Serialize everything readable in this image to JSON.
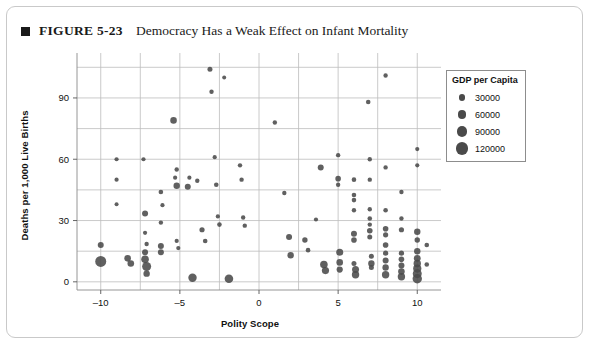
{
  "figure": {
    "marker_icon": "square-bullet-icon",
    "number": "FIGURE 5-23",
    "title": "Democracy Has a Weak Effect on Infant Mortality"
  },
  "legend": {
    "title": "GDP per Capita",
    "entries": [
      {
        "label": "30000",
        "size": 5.0
      },
      {
        "label": "60000",
        "size": 6.4
      },
      {
        "label": "90000",
        "size": 7.8
      },
      {
        "label": "120000",
        "size": 9.4
      }
    ]
  },
  "chart_data": {
    "type": "scatter",
    "title": "Democracy Has a Weak Effect on Infant Mortality",
    "xlabel": "Polity Scope",
    "ylabel": "Deaths per 1,000 Live Births",
    "xlim": [
      -11.5,
      11.5
    ],
    "ylim": [
      -4,
      112
    ],
    "xticks": [
      -10,
      -5,
      0,
      5,
      10
    ],
    "xtick_labels": [
      "–10",
      "–5",
      "0",
      "5",
      "10"
    ],
    "yticks": [
      0,
      30,
      60,
      90
    ],
    "ytick_labels": [
      "0",
      "30",
      "60",
      "90"
    ],
    "grid": true,
    "grid_x_step": 2.5,
    "grid_y_step": 15,
    "legend_position": "right",
    "size_encoding": "GDP per Capita",
    "size_legend_values": [
      30000,
      60000,
      90000,
      120000
    ],
    "marker_color": "#4a4a4a",
    "points": [
      {
        "x": -10.0,
        "y": 18.0,
        "s": 6.0
      },
      {
        "x": -10.0,
        "y": 10.0,
        "s": 11.0
      },
      {
        "x": -9.0,
        "y": 60.0,
        "s": 4.2
      },
      {
        "x": -9.0,
        "y": 50.0,
        "s": 4.2
      },
      {
        "x": -9.0,
        "y": 38.0,
        "s": 4.0
      },
      {
        "x": -8.3,
        "y": 11.5,
        "s": 6.6
      },
      {
        "x": -8.1,
        "y": 9.0,
        "s": 6.6
      },
      {
        "x": -7.3,
        "y": 60.0,
        "s": 4.2
      },
      {
        "x": -7.2,
        "y": 33.5,
        "s": 6.0
      },
      {
        "x": -7.2,
        "y": 24.0,
        "s": 4.2
      },
      {
        "x": -7.1,
        "y": 18.5,
        "s": 4.4
      },
      {
        "x": -7.2,
        "y": 14.5,
        "s": 6.0
      },
      {
        "x": -7.2,
        "y": 11.0,
        "s": 7.6
      },
      {
        "x": -7.1,
        "y": 7.5,
        "s": 9.0
      },
      {
        "x": -7.1,
        "y": 4.0,
        "s": 6.4
      },
      {
        "x": -6.2,
        "y": 44.0,
        "s": 4.6
      },
      {
        "x": -6.1,
        "y": 37.5,
        "s": 4.2
      },
      {
        "x": -6.2,
        "y": 29.0,
        "s": 4.4
      },
      {
        "x": -6.2,
        "y": 17.5,
        "s": 6.0
      },
      {
        "x": -6.2,
        "y": 14.5,
        "s": 6.0
      },
      {
        "x": -5.4,
        "y": 79.0,
        "s": 6.6
      },
      {
        "x": -5.2,
        "y": 55.0,
        "s": 4.4
      },
      {
        "x": -5.3,
        "y": 51.0,
        "s": 4.2
      },
      {
        "x": -5.2,
        "y": 47.0,
        "s": 6.4
      },
      {
        "x": -5.2,
        "y": 20.0,
        "s": 4.2
      },
      {
        "x": -5.1,
        "y": 16.5,
        "s": 4.2
      },
      {
        "x": -4.4,
        "y": 51.0,
        "s": 4.2
      },
      {
        "x": -4.5,
        "y": 46.5,
        "s": 6.0
      },
      {
        "x": -4.2,
        "y": 2.0,
        "s": 8.4
      },
      {
        "x": -3.9,
        "y": 49.5,
        "s": 4.4
      },
      {
        "x": -3.6,
        "y": 25.5,
        "s": 5.2
      },
      {
        "x": -3.4,
        "y": 20.0,
        "s": 4.6
      },
      {
        "x": -3.1,
        "y": 104.0,
        "s": 5.0
      },
      {
        "x": -3.0,
        "y": 93.0,
        "s": 4.4
      },
      {
        "x": -2.8,
        "y": 61.0,
        "s": 4.2
      },
      {
        "x": -2.7,
        "y": 47.5,
        "s": 4.6
      },
      {
        "x": -2.6,
        "y": 32.0,
        "s": 4.2
      },
      {
        "x": -2.5,
        "y": 28.0,
        "s": 4.6
      },
      {
        "x": -2.2,
        "y": 100.0,
        "s": 4.0
      },
      {
        "x": -1.9,
        "y": 1.5,
        "s": 8.6
      },
      {
        "x": -1.2,
        "y": 57.0,
        "s": 4.4
      },
      {
        "x": -1.1,
        "y": 50.0,
        "s": 4.4
      },
      {
        "x": -1.0,
        "y": 31.5,
        "s": 4.4
      },
      {
        "x": -0.9,
        "y": 27.5,
        "s": 4.4
      },
      {
        "x": 1.0,
        "y": 78.0,
        "s": 4.4
      },
      {
        "x": 1.6,
        "y": 43.5,
        "s": 4.4
      },
      {
        "x": 1.9,
        "y": 22.0,
        "s": 6.0
      },
      {
        "x": 2.0,
        "y": 13.0,
        "s": 6.4
      },
      {
        "x": 2.9,
        "y": 20.5,
        "s": 5.4
      },
      {
        "x": 3.1,
        "y": 15.5,
        "s": 4.6
      },
      {
        "x": 3.6,
        "y": 30.5,
        "s": 4.2
      },
      {
        "x": 3.9,
        "y": 56.0,
        "s": 6.0
      },
      {
        "x": 4.1,
        "y": 8.5,
        "s": 7.6
      },
      {
        "x": 4.2,
        "y": 5.5,
        "s": 7.2
      },
      {
        "x": 5.0,
        "y": 62.0,
        "s": 4.4
      },
      {
        "x": 5.0,
        "y": 50.5,
        "s": 5.6
      },
      {
        "x": 5.0,
        "y": 47.5,
        "s": 4.4
      },
      {
        "x": 5.1,
        "y": 14.5,
        "s": 7.0
      },
      {
        "x": 5.1,
        "y": 9.5,
        "s": 6.6
      },
      {
        "x": 5.1,
        "y": 6.0,
        "s": 6.2
      },
      {
        "x": 6.0,
        "y": 50.0,
        "s": 4.6
      },
      {
        "x": 6.0,
        "y": 42.5,
        "s": 4.6
      },
      {
        "x": 6.0,
        "y": 40.0,
        "s": 4.6
      },
      {
        "x": 6.0,
        "y": 35.0,
        "s": 4.4
      },
      {
        "x": 6.0,
        "y": 23.5,
        "s": 6.0
      },
      {
        "x": 6.0,
        "y": 20.5,
        "s": 5.6
      },
      {
        "x": 6.0,
        "y": 9.0,
        "s": 5.0
      },
      {
        "x": 6.1,
        "y": 6.0,
        "s": 7.0
      },
      {
        "x": 6.1,
        "y": 3.5,
        "s": 7.4
      },
      {
        "x": 6.9,
        "y": 88.0,
        "s": 4.6
      },
      {
        "x": 7.0,
        "y": 60.0,
        "s": 4.4
      },
      {
        "x": 7.0,
        "y": 50.0,
        "s": 4.4
      },
      {
        "x": 7.0,
        "y": 35.5,
        "s": 4.4
      },
      {
        "x": 7.0,
        "y": 31.0,
        "s": 4.6
      },
      {
        "x": 7.0,
        "y": 28.0,
        "s": 4.4
      },
      {
        "x": 7.0,
        "y": 25.0,
        "s": 5.6
      },
      {
        "x": 7.0,
        "y": 22.0,
        "s": 5.0
      },
      {
        "x": 7.1,
        "y": 12.5,
        "s": 5.0
      },
      {
        "x": 7.1,
        "y": 9.0,
        "s": 6.4
      },
      {
        "x": 7.1,
        "y": 7.0,
        "s": 5.0
      },
      {
        "x": 8.0,
        "y": 101.0,
        "s": 4.4
      },
      {
        "x": 8.0,
        "y": 56.0,
        "s": 4.4
      },
      {
        "x": 8.0,
        "y": 35.0,
        "s": 4.6
      },
      {
        "x": 8.0,
        "y": 26.0,
        "s": 5.6
      },
      {
        "x": 8.0,
        "y": 23.0,
        "s": 5.2
      },
      {
        "x": 8.0,
        "y": 18.0,
        "s": 5.6
      },
      {
        "x": 8.0,
        "y": 14.0,
        "s": 5.2
      },
      {
        "x": 8.0,
        "y": 10.5,
        "s": 6.0
      },
      {
        "x": 8.0,
        "y": 7.0,
        "s": 6.4
      },
      {
        "x": 8.0,
        "y": 3.5,
        "s": 7.4
      },
      {
        "x": 9.0,
        "y": 44.0,
        "s": 4.4
      },
      {
        "x": 9.0,
        "y": 31.0,
        "s": 4.4
      },
      {
        "x": 9.0,
        "y": 25.5,
        "s": 5.2
      },
      {
        "x": 9.0,
        "y": 14.0,
        "s": 5.2
      },
      {
        "x": 9.0,
        "y": 11.0,
        "s": 5.6
      },
      {
        "x": 9.0,
        "y": 8.0,
        "s": 6.0
      },
      {
        "x": 9.0,
        "y": 5.0,
        "s": 6.6
      },
      {
        "x": 9.0,
        "y": 2.5,
        "s": 7.4
      },
      {
        "x": 10.0,
        "y": 65.0,
        "s": 4.2
      },
      {
        "x": 10.0,
        "y": 57.0,
        "s": 4.2
      },
      {
        "x": 10.0,
        "y": 24.5,
        "s": 6.4
      },
      {
        "x": 10.0,
        "y": 20.5,
        "s": 5.4
      },
      {
        "x": 10.0,
        "y": 15.0,
        "s": 6.4
      },
      {
        "x": 10.0,
        "y": 11.5,
        "s": 6.8
      },
      {
        "x": 10.0,
        "y": 9.0,
        "s": 7.4
      },
      {
        "x": 10.0,
        "y": 6.5,
        "s": 8.2
      },
      {
        "x": 10.0,
        "y": 4.0,
        "s": 9.0
      },
      {
        "x": 10.0,
        "y": 1.5,
        "s": 9.4
      },
      {
        "x": 10.6,
        "y": 18.0,
        "s": 4.6
      },
      {
        "x": 10.6,
        "y": 8.5,
        "s": 4.6
      }
    ]
  }
}
